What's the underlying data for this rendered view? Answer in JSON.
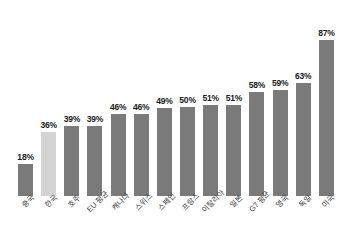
{
  "chart_data": {
    "type": "bar",
    "title": "",
    "subtitle": "",
    "xlabel": "",
    "ylabel": "",
    "ylim": [
      0,
      100
    ],
    "grid": false,
    "legend": false,
    "value_suffix": "%",
    "categories": [
      "중국",
      "한국",
      "호주",
      "EU 평균",
      "캐나다",
      "스위스",
      "스페인",
      "프랑스",
      "이탈리아",
      "일본",
      "G7 평균",
      "영국",
      "독일",
      "미국"
    ],
    "values": [
      18,
      36,
      39,
      39,
      46,
      46,
      49,
      50,
      51,
      51,
      58,
      59,
      63,
      87
    ],
    "value_labels": [
      "18%",
      "36%",
      "39%",
      "39%",
      "46%",
      "46%",
      "49%",
      "50%",
      "51%",
      "51%",
      "58%",
      "59%",
      "63%",
      "87%"
    ],
    "highlight_index": 1,
    "colors": {
      "bar": "#7a7a7a",
      "bar_highlight": "#d4d4d4",
      "value_text": "#1a1a1a",
      "axis_text": "#3a3a3a",
      "background": "#ffffff"
    }
  }
}
